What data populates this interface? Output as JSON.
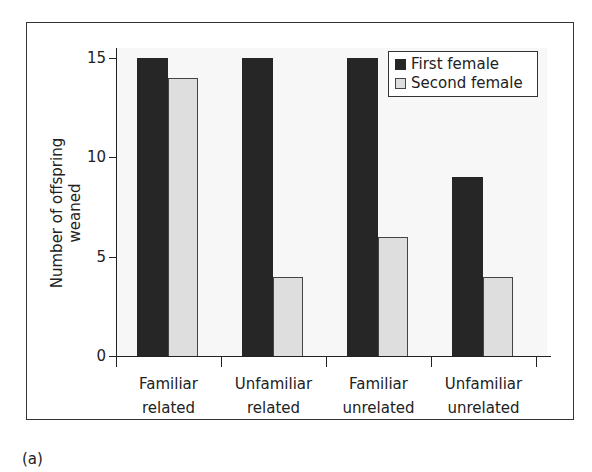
{
  "chart_data": {
    "type": "bar",
    "title": "",
    "xlabel": "",
    "ylabel": "Number of offspring weaned",
    "ylim": [
      0,
      15
    ],
    "yticks": [
      0,
      5,
      10,
      15
    ],
    "categories": [
      "Familiar related",
      "Unfamiliar related",
      "Familiar unrelated",
      "Unfamiliar unrelated"
    ],
    "category_lines": [
      [
        "Familiar",
        "related"
      ],
      [
        "Unfamiliar",
        "related"
      ],
      [
        "Familiar",
        "unrelated"
      ],
      [
        "Unfamiliar",
        "unrelated"
      ]
    ],
    "series": [
      {
        "name": "First female",
        "color": "#262626",
        "values": [
          15,
          15,
          15,
          9
        ]
      },
      {
        "name": "Second female",
        "color": "#dedede",
        "values": [
          14,
          4,
          6,
          4
        ]
      }
    ],
    "legend_position": "top-right",
    "grid": false
  },
  "panel_label": "(a)"
}
